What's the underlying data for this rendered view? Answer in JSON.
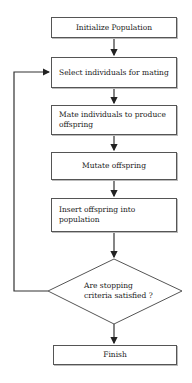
{
  "flowchart": {
    "nodes": [
      {
        "id": "init",
        "type": "process",
        "label": "Initialize Population"
      },
      {
        "id": "select",
        "type": "process",
        "label": "Select individuals for mating"
      },
      {
        "id": "mate",
        "type": "process",
        "label": "Mate individuals to produce offspring"
      },
      {
        "id": "mutate",
        "type": "process",
        "label": "Mutate offspring"
      },
      {
        "id": "insert",
        "type": "process",
        "label": "Insert offspring into population"
      },
      {
        "id": "check",
        "type": "decision",
        "label_line1": "Are stopping",
        "label_line2": "criteria satisfied ?"
      },
      {
        "id": "finish",
        "type": "process",
        "label": "Finish"
      }
    ],
    "edges": [
      {
        "from": "init",
        "to": "select"
      },
      {
        "from": "select",
        "to": "mate"
      },
      {
        "from": "mate",
        "to": "mutate"
      },
      {
        "from": "mutate",
        "to": "insert"
      },
      {
        "from": "insert",
        "to": "check"
      },
      {
        "from": "check",
        "to": "finish"
      },
      {
        "from": "check",
        "to": "select",
        "note": "loop back"
      }
    ]
  }
}
